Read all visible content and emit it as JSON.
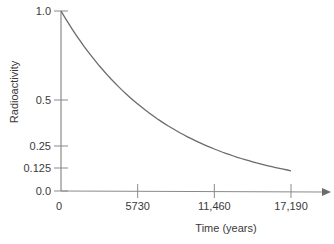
{
  "chart_data": {
    "type": "line",
    "title": "",
    "xlabel": "Time (years)",
    "ylabel": "Radioactivity",
    "x_ticks": [
      {
        "value": 0,
        "label": "0"
      },
      {
        "value": 5730,
        "label": "5730"
      },
      {
        "value": 11460,
        "label": "11,460"
      },
      {
        "value": 17190,
        "label": "17,190"
      }
    ],
    "y_ticks": [
      {
        "value": 0.0,
        "label": "0.0"
      },
      {
        "value": 0.125,
        "label": "0.125"
      },
      {
        "value": 0.25,
        "label": "0.25"
      },
      {
        "value": 0.5,
        "label": "0.5"
      },
      {
        "value": 1.0,
        "label": "1.0"
      }
    ],
    "xlim": [
      0,
      17190
    ],
    "ylim": [
      0,
      1.0
    ],
    "grid": false,
    "legend": null,
    "series": [
      {
        "name": "Carbon-14 decay",
        "x": [
          0,
          2865,
          5730,
          8595,
          11460,
          14325,
          17190
        ],
        "values": [
          1.0,
          0.707,
          0.5,
          0.354,
          0.25,
          0.177,
          0.125
        ]
      }
    ],
    "colors": {
      "line": "#6b6b6b",
      "axis": "#8a8a8a",
      "text": "#3a3a3a"
    }
  }
}
